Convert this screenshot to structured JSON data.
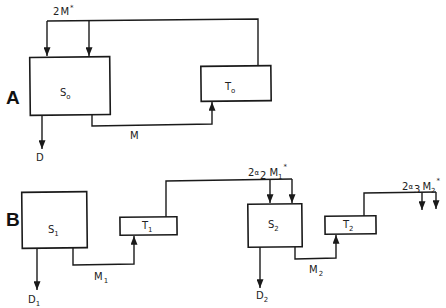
{
  "panels": {
    "A": {
      "label": "A",
      "source": {
        "name": "S",
        "sub": "o"
      },
      "target": {
        "name": "T",
        "sub": "o"
      },
      "demand": {
        "name": "D"
      },
      "flow": {
        "name": "M"
      },
      "feedback": {
        "coef": "2",
        "name": "M",
        "sup": "*"
      }
    },
    "B": {
      "label": "B",
      "source1": {
        "name": "S",
        "sub": "1"
      },
      "target1": {
        "name": "T",
        "sub": "1"
      },
      "demand1": {
        "name": "D",
        "sub": "1"
      },
      "flow1": {
        "name": "M",
        "sub": "1"
      },
      "source2": {
        "name": "S",
        "sub": "2"
      },
      "target2": {
        "name": "T",
        "sub": "2"
      },
      "demand2": {
        "name": "D",
        "sub": "2"
      },
      "flow2": {
        "name": "M",
        "sub": "2"
      },
      "feedback1": {
        "coef": "2",
        "greek": "α",
        "greek_sub": "2",
        "name": "M",
        "sub": "1",
        "sup": "*"
      },
      "feedback2": {
        "coef": "2",
        "greek": "α",
        "greek_sub": "3",
        "name": "M",
        "sub": "2",
        "sup": "*"
      }
    }
  },
  "colors": {
    "line": "#1a1a1a",
    "background": "#ffffff"
  }
}
